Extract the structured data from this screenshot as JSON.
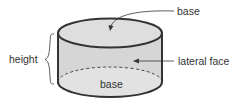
{
  "diagram": {
    "labels": {
      "top_base": "base",
      "bottom_base": "base",
      "height": "height",
      "lateral_face": "lateral face"
    },
    "colors": {
      "stroke": "#333333",
      "top_fill": "#dedede",
      "side_fill": "#d6d6d6",
      "bottom_fill": "#e2e2e2",
      "text": "#333333"
    }
  }
}
